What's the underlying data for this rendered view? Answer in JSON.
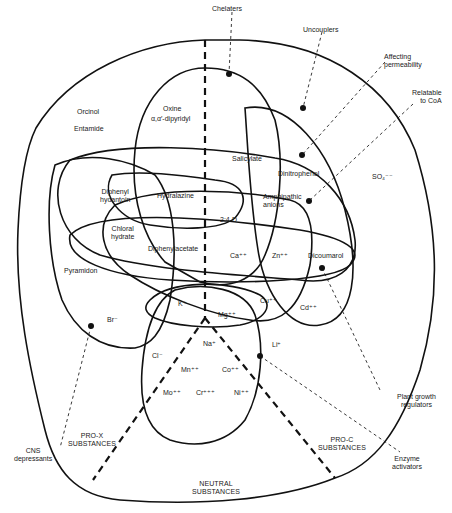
{
  "diagram": {
    "type": "venn-diagram",
    "regions": {
      "pro_x": "PRO-X\nSUBSTANCES",
      "pro_c": "PRO-C\nSUBSTANCES",
      "neutral": "NEUTRAL\nSUBSTANCES"
    },
    "callouts": {
      "chelaters": "Chelaters",
      "uncouplers": "Uncouplers",
      "affecting_permeability": "Affecting\npermeability",
      "relatable_to_coa": "Relatable\nto CoA",
      "plant_growth_regulators": "Plant growth\nregulators",
      "enzyme_activators": "Enzyme\nactivators",
      "cns_depressants": "CNS\ndepressants"
    },
    "substances": {
      "orcinol": "Orcinol",
      "entamide": "Entamide",
      "oxine": "Oxine",
      "dipyridyl": "α,α′-dipyridyl",
      "salicylate": "Salicylate",
      "dinitrophenol": "Dinitrophenol",
      "amphipathic_anions": "Amphipathic\nanions",
      "so4": "SO₄⁻⁻",
      "diphenyl_hydantoin": "Diphenyl\nhydantoin",
      "hydralazine": "Hydralazine",
      "d24": "2:4-D",
      "chloral_hydrate": "Chloral\nhydrate",
      "diphenylacetate": "Diphenylacetate",
      "ca": "Ca⁺⁺",
      "zn": "Zn⁺⁺",
      "dicoumarol": "Dicoumarol",
      "pyramidon": "Pyramidon",
      "k": "K⁺",
      "mg": "Mg⁺⁺",
      "cu": "Cu⁺⁺",
      "cd": "Cd⁺⁺",
      "br": "Br⁻",
      "na": "Na⁺",
      "li": "Li⁺",
      "cl": "Cl⁻",
      "mn": "Mn⁺⁺",
      "co": "Co⁺⁺",
      "mo": "Mo⁺⁺",
      "cr": "Cr⁺⁺⁺",
      "ni": "Ni⁺⁺"
    }
  }
}
